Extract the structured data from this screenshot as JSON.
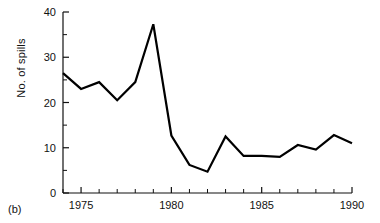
{
  "figure": {
    "panel_caption": "(b)",
    "y_axis_label": "No. of spills",
    "x_axis_label": ""
  },
  "chart_data": {
    "type": "line",
    "title": "",
    "subtitle": "",
    "xlabel": "",
    "ylabel": "No. of spills",
    "xlim": [
      1974,
      1990
    ],
    "ylim": [
      0,
      40
    ],
    "grid": false,
    "legend": null,
    "legend_position": "none",
    "annotations": [
      "(b)"
    ],
    "x_ticks_major": [
      1975,
      1980,
      1985,
      1990
    ],
    "x_tick_labels": [
      "1975",
      "1980",
      "1985",
      "1990"
    ],
    "x_ticks_minor": [
      1974,
      1976,
      1977,
      1978,
      1979,
      1981,
      1982,
      1983,
      1984,
      1986,
      1987,
      1988,
      1989
    ],
    "y_ticks_major": [
      0,
      10,
      20,
      30,
      40
    ],
    "y_tick_labels": [
      "0",
      "10",
      "20",
      "30",
      "40"
    ],
    "y_ticks_minor": [
      5,
      15,
      25,
      35
    ],
    "line_color": "#000000",
    "line_width": 2.2,
    "x": [
      1974,
      1975,
      1976,
      1977,
      1978,
      1979,
      1980,
      1981,
      1982,
      1983,
      1984,
      1985,
      1986,
      1987,
      1988,
      1989,
      1990
    ],
    "values": [
      26.5,
      23.0,
      24.5,
      20.5,
      24.5,
      37.3,
      12.7,
      6.2,
      4.7,
      12.5,
      8.2,
      8.2,
      8.0,
      10.6,
      9.6,
      12.8,
      11.0
    ],
    "series": [
      {
        "name": "No. of spills",
        "values": [
          26.5,
          23.0,
          24.5,
          20.5,
          24.5,
          37.3,
          12.7,
          6.2,
          4.7,
          12.5,
          8.2,
          8.2,
          8.0,
          10.6,
          9.6,
          12.8,
          11.0
        ]
      }
    ]
  }
}
